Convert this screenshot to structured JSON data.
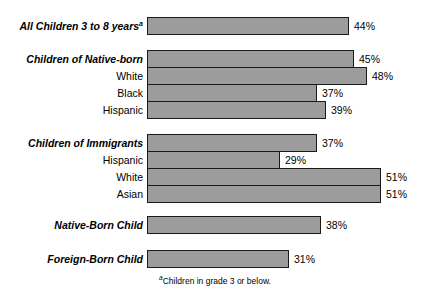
{
  "chart_data": {
    "type": "bar",
    "orientation": "horizontal",
    "title": "",
    "xlabel": "",
    "ylabel": "",
    "xlim": [
      0,
      55
    ],
    "grid": false,
    "legend": null,
    "value_suffix": "%",
    "categories": [
      "All Children 3 to 8 years",
      "Children of Native-born",
      "White",
      "Black",
      "Hispanic",
      "Children of Immigrants",
      "Hispanic",
      "White",
      "Asian",
      "Native-Born Child",
      "Foreign-Born Child"
    ],
    "values": [
      44,
      45,
      48,
      37,
      39,
      37,
      29,
      51,
      51,
      38,
      31
    ],
    "footnote": "Children in grade 3 or below.",
    "footnote_marker": "a"
  },
  "rows": [
    {
      "label": "All Children 3 to 8 years",
      "marker": "a",
      "style": "group",
      "value": 44,
      "value_label": "44%",
      "top": 17
    },
    {
      "label": "Children of Native-born",
      "marker": "",
      "style": "group",
      "value": 45,
      "value_label": "45%",
      "top": 50
    },
    {
      "label": "White",
      "marker": "",
      "style": "sub",
      "value": 48,
      "value_label": "48%",
      "top": 67
    },
    {
      "label": "Black",
      "marker": "",
      "style": "sub",
      "value": 37,
      "value_label": "37%",
      "top": 84
    },
    {
      "label": "Hispanic",
      "marker": "",
      "style": "sub",
      "value": 39,
      "value_label": "39%",
      "top": 101
    },
    {
      "label": "Children of Immigrants",
      "marker": "",
      "style": "group",
      "value": 37,
      "value_label": "37%",
      "top": 134
    },
    {
      "label": "Hispanic",
      "marker": "",
      "style": "sub",
      "value": 29,
      "value_label": "29%",
      "top": 151
    },
    {
      "label": "White",
      "marker": "",
      "style": "sub",
      "value": 51,
      "value_label": "51%",
      "top": 168
    },
    {
      "label": "Asian",
      "marker": "",
      "style": "sub",
      "value": 51,
      "value_label": "51%",
      "top": 185
    },
    {
      "label": "Native-Born Child",
      "marker": "",
      "style": "group",
      "value": 38,
      "value_label": "38%",
      "top": 216
    },
    {
      "label": "Foreign-Born Child",
      "marker": "",
      "style": "group",
      "value": 31,
      "value_label": "31%",
      "top": 250
    }
  ],
  "style": {
    "bar_fill": "#9c9c9c",
    "bar_stroke": "#1a1a1a",
    "background": "#ffffff",
    "text_color": "#000000"
  },
  "geometry": {
    "bar_left_px": 147,
    "px_per_percent": 4.59,
    "bar_height_px": 18
  },
  "footnote": {
    "marker": "a",
    "text": "Children in grade 3 or below."
  }
}
